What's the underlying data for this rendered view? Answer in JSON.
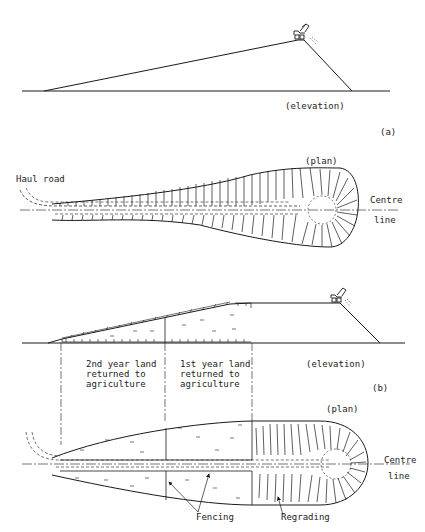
{
  "figure": {
    "panel_a": {
      "tag": "(a)",
      "elevation_label": "(elevation)",
      "plan_label": "(plan)",
      "haul_road_label": "Haul road",
      "centre_line_label_1": "Centre",
      "centre_line_label_2": "line"
    },
    "panel_b": {
      "tag": "(b)",
      "elevation_label": "(elevation)",
      "plan_label": "(plan)",
      "zone_2nd_year": "2nd year land\nreturned to\nagriculture",
      "zone_1st_year": "1st year land\nreturned to\nagriculture",
      "centre_line_label_1": "Centre",
      "centre_line_label_2": "line",
      "fencing_label": "Fencing",
      "regrading_label": "Regrading"
    },
    "colors": {
      "ink": "#1a1a1a",
      "paper": "#ffffff"
    }
  }
}
